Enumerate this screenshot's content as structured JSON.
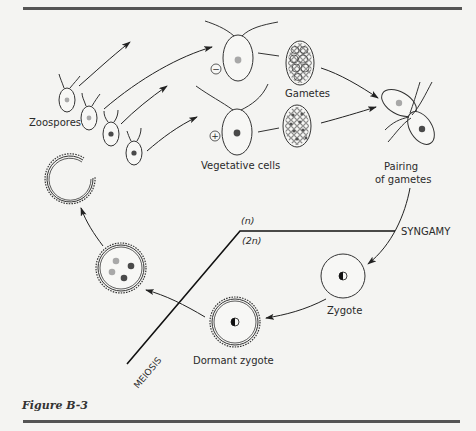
{
  "figure": {
    "caption": "Figure B-3",
    "colors": {
      "rule": "#555555",
      "ink": "#2a2a2a",
      "nucleus_light": "#a8a8a8",
      "nucleus_dark": "#4a4a4a",
      "background": "#f4f4f2"
    }
  },
  "labels": {
    "zoospores": "Zoospores",
    "vegetative_cells": "Vegetative cells",
    "gametes": "Gametes",
    "pairing_line1": "Pairing",
    "pairing_line2": "of gametes",
    "haploid": "(n)",
    "diploid": "(2n)",
    "syngamy": "SYNGAMY",
    "zygote": "Zygote",
    "dormant_zygote": "Dormant zygote",
    "meiosis": "MEIOSIS"
  },
  "mating_signs": {
    "minus": "−",
    "plus": "+"
  },
  "stages": [
    {
      "id": "zoospores",
      "count": 4
    },
    {
      "id": "vegetative-cell-minus",
      "sign": "−"
    },
    {
      "id": "vegetative-cell-plus",
      "sign": "+"
    },
    {
      "id": "gametes-minus"
    },
    {
      "id": "gametes-plus"
    },
    {
      "id": "pairing-of-gametes"
    },
    {
      "id": "zygote"
    },
    {
      "id": "dormant-zygote"
    },
    {
      "id": "meiosis-cell",
      "nuclei": 4
    },
    {
      "id": "released-wall"
    }
  ]
}
